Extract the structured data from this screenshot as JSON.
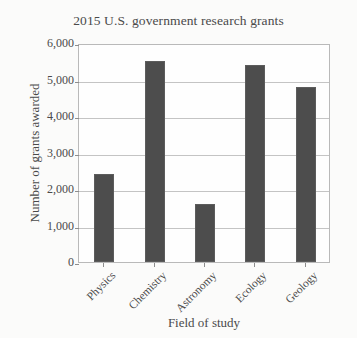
{
  "chart_data": {
    "type": "bar",
    "title": "2015 U.S. government research grants",
    "xlabel": "Field of study",
    "ylabel": "Number of grants awarded",
    "categories": [
      "Physics",
      "Chemistry",
      "Astronomy",
      "Ecology",
      "Geology"
    ],
    "values": [
      2400,
      5500,
      1600,
      5400,
      4800
    ],
    "ylim": [
      0,
      6000
    ],
    "ytick_labels": [
      "0",
      "1,000",
      "2,000",
      "3,000",
      "4,000",
      "5,000",
      "6,000"
    ],
    "ytick_values": [
      0,
      1000,
      2000,
      3000,
      4000,
      5000,
      6000
    ],
    "grid": true,
    "grid_axis": "y",
    "legend": false,
    "legend_position": "none",
    "bar_color": "#4d4d4d",
    "grid_color": "#c4c4c4",
    "axis_color": "#b9b9b9",
    "background_color": "#fefefe",
    "text_color": "#4a4a4a",
    "xtick_label_rotation": -45
  }
}
